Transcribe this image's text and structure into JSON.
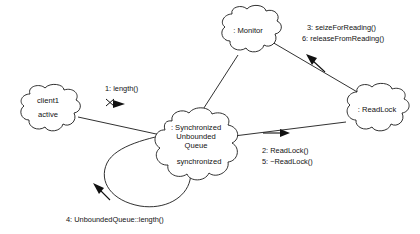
{
  "diagram": {
    "type": "uml-collaboration-diagram",
    "title": "",
    "background_color": "#ffffff",
    "line_color": "#1a1a1a",
    "text_color": "#111111",
    "nodes": [
      {
        "id": "client1",
        "name_line1": "client1",
        "name_line2": "active",
        "shape": "cloud",
        "cx": 47,
        "cy": 108
      },
      {
        "id": "monitor",
        "name_line1": ": Monitor",
        "name_line2": "",
        "shape": "cloud",
        "cx": 248,
        "cy": 32
      },
      {
        "id": "queue",
        "name_line1": ": Synchronized",
        "name_line2": "Unbounded",
        "name_line3": "Queue",
        "name_line4": "synchronized",
        "shape": "cloud",
        "cx": 196,
        "cy": 143
      },
      {
        "id": "readlock",
        "name_line1": ": ReadLock",
        "name_line2": "",
        "shape": "cloud",
        "cx": 376,
        "cy": 110
      }
    ],
    "messages": [
      {
        "id": "msg1",
        "label": "1: length()",
        "sequence": "1",
        "from": "client1",
        "to": "queue",
        "direction": "right"
      },
      {
        "id": "msg2",
        "label": "2: ReadLock()",
        "sequence": "2",
        "from": "queue",
        "to": "readlock",
        "direction": "right"
      },
      {
        "id": "msg5",
        "label": "5: ~ReadLock()",
        "sequence": "5",
        "from": "queue",
        "to": "readlock",
        "direction": "right"
      },
      {
        "id": "msg3",
        "label": "3: seizeForReading()",
        "sequence": "3",
        "from": "readlock",
        "to": "monitor",
        "direction": "up-left"
      },
      {
        "id": "msg6",
        "label": "6: releaseFromReading()",
        "sequence": "6",
        "from": "readlock",
        "to": "monitor",
        "direction": "up-left"
      },
      {
        "id": "msg4",
        "label": "4: UnboundedQueue::length()",
        "sequence": "4",
        "from": "queue",
        "to": "queue",
        "direction": "self-loop"
      }
    ],
    "links": [
      {
        "id": "link-client-queue",
        "from": "client1",
        "to": "queue"
      },
      {
        "id": "link-queue-monitor",
        "from": "queue",
        "to": "monitor"
      },
      {
        "id": "link-queue-readlock",
        "from": "queue",
        "to": "readlock"
      },
      {
        "id": "link-monitor-readlock",
        "from": "monitor",
        "to": "readlock"
      }
    ]
  }
}
